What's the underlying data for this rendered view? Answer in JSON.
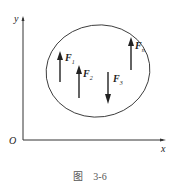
{
  "figure": {
    "axes": {
      "x_label": "x",
      "y_label": "y",
      "origin_label": "O"
    },
    "forces": [
      {
        "symbol": "F",
        "subscript": "1",
        "direction": "up"
      },
      {
        "symbol": "F",
        "subscript": "2",
        "direction": "up"
      },
      {
        "symbol": "F",
        "subscript": "3",
        "direction": "down"
      },
      {
        "symbol": "F",
        "subscript": "n",
        "direction": "up"
      }
    ],
    "caption": "图　3-6"
  },
  "colors": {
    "stroke": "#222222",
    "caption": "#555555"
  }
}
